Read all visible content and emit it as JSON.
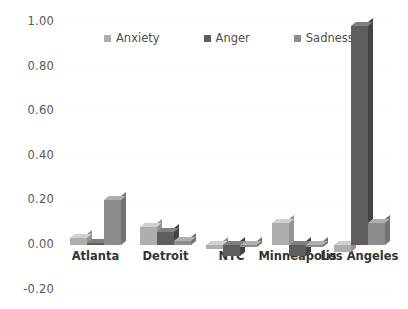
{
  "chart_data": {
    "type": "bar",
    "title": "",
    "subtitle": "",
    "xlabel": "",
    "ylabel": "",
    "ylim": [
      -0.2,
      1.0
    ],
    "ytick_labels": [
      "1.00",
      "0.80",
      "0.60",
      "0.40",
      "0.20",
      "0.00",
      "-0.20"
    ],
    "ytick_values": [
      1.0,
      0.8,
      0.6,
      0.4,
      0.2,
      0.0,
      -0.2
    ],
    "grid": true,
    "legend_position": "top-center",
    "categories": [
      "Atlanta",
      "Detroit",
      "NYC",
      "Minneapolis",
      "Los Angeles"
    ],
    "series": [
      {
        "name": "Anxiety",
        "color": "#aeaeae",
        "values": [
          0.03,
          0.08,
          -0.02,
          0.1,
          -0.03
        ]
      },
      {
        "name": "Anger",
        "color": "#5e5e5e",
        "values": [
          0.01,
          0.06,
          -0.05,
          -0.05,
          0.98
        ]
      },
      {
        "name": "Sadness",
        "color": "#8d8d8d",
        "values": [
          0.2,
          0.02,
          0.0,
          0.0,
          0.1
        ]
      }
    ]
  },
  "axis": {
    "ticks": [
      {
        "label": "1.00"
      },
      {
        "label": "0.80"
      },
      {
        "label": "0.60"
      },
      {
        "label": "0.40"
      },
      {
        "label": "0.20"
      },
      {
        "label": "0.00"
      },
      {
        "label": "-0.20"
      }
    ]
  },
  "legend": {
    "entries": [
      {
        "label": "Anxiety"
      },
      {
        "label": "Anger"
      },
      {
        "label": "Sadness"
      }
    ]
  },
  "xaxis": {
    "labels": [
      "Atlanta",
      "Detroit",
      "NYC",
      "Minneapolis",
      "Los Angeles"
    ]
  },
  "colors": {
    "anxiety": "#aeaeae",
    "anger": "#5e5e5e",
    "sadness": "#8d8d8d",
    "gridline": "#fbfbfb",
    "tick_text": "#595959",
    "label_text": "#333333",
    "background": "#ffffff"
  }
}
